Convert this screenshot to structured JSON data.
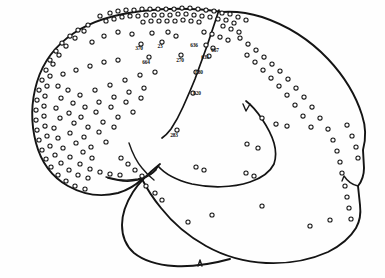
{
  "figure": {
    "background_color": "#fefefe",
    "ink_color": "#141414",
    "dot_fill_color": "#ffffff",
    "view": "lateral",
    "orientation": "frontal pole at left, occipital pole at right"
  },
  "anatomy": {
    "structures": [
      {
        "name": "cerebral-hemisphere-outline",
        "label": "Cerebral hemisphere outline"
      },
      {
        "name": "central-sulcus",
        "label": "Central sulcus"
      },
      {
        "name": "lateral-sulcus",
        "label": "Lateral (Sylvian) fissure"
      },
      {
        "name": "temporal-lobe",
        "label": "Temporal lobe"
      },
      {
        "name": "precentral-sulcus-branch",
        "label": "Precentral sulcus branch"
      },
      {
        "name": "superior-temporal-sulcus",
        "label": "Superior temporal sulcus"
      },
      {
        "name": "occipital-notch",
        "label": "Occipital notch"
      },
      {
        "name": "preoccipital-incisure",
        "label": "Preoccipital incisure"
      }
    ]
  },
  "labels": [
    {
      "id": "label-370",
      "text": "370",
      "x": 139,
      "y": 50,
      "marker_x": 141,
      "marker_y": 44
    },
    {
      "id": "label-23",
      "text": "23",
      "x": 160,
      "y": 48,
      "marker_x": 162,
      "marker_y": 42
    },
    {
      "id": "label-664",
      "text": "664",
      "x": 146,
      "y": 64,
      "marker_x": 149,
      "marker_y": 57
    },
    {
      "id": "label-270",
      "text": "270",
      "x": 180,
      "y": 62,
      "marker_x": 181,
      "marker_y": 55
    },
    {
      "id": "label-636",
      "text": "636",
      "x": 194,
      "y": 47,
      "marker_x": 206,
      "marker_y": 45
    },
    {
      "id": "label-667",
      "text": "667",
      "x": 215,
      "y": 52,
      "marker_x": 213,
      "marker_y": 48
    },
    {
      "id": "label-633",
      "text": "633",
      "x": 205,
      "y": 59,
      "marker_x": 209,
      "marker_y": 56
    },
    {
      "id": "label-680",
      "text": "680",
      "x": 199,
      "y": 74,
      "marker_x": 196,
      "marker_y": 72
    },
    {
      "id": "label-620",
      "text": "620",
      "x": 197,
      "y": 95,
      "marker_x": 193,
      "marker_y": 93
    },
    {
      "id": "label-283",
      "text": "283",
      "x": 174,
      "y": 137,
      "marker_x": 177,
      "marker_y": 130
    }
  ],
  "stimulation_points": {
    "count_visible": 152,
    "marker_shape": "open-circle",
    "marker_radius_px": 2.1,
    "coordinates": [
      [
        100,
        16
      ],
      [
        110,
        13
      ],
      [
        118,
        11
      ],
      [
        126,
        10
      ],
      [
        134,
        10
      ],
      [
        142,
        9
      ],
      [
        150,
        9
      ],
      [
        158,
        9
      ],
      [
        166,
        9
      ],
      [
        174,
        9
      ],
      [
        182,
        8
      ],
      [
        190,
        8
      ],
      [
        198,
        9
      ],
      [
        206,
        10
      ],
      [
        214,
        11
      ],
      [
        222,
        13
      ],
      [
        106,
        21
      ],
      [
        114,
        19
      ],
      [
        122,
        17
      ],
      [
        130,
        16
      ],
      [
        138,
        16
      ],
      [
        146,
        15
      ],
      [
        154,
        15
      ],
      [
        162,
        15
      ],
      [
        170,
        15
      ],
      [
        178,
        14
      ],
      [
        186,
        14
      ],
      [
        194,
        15
      ],
      [
        202,
        16
      ],
      [
        210,
        17
      ],
      [
        218,
        19
      ],
      [
        143,
        22
      ],
      [
        151,
        21
      ],
      [
        159,
        21
      ],
      [
        167,
        21
      ],
      [
        175,
        21
      ],
      [
        183,
        20
      ],
      [
        191,
        21
      ],
      [
        199,
        22
      ],
      [
        230,
        14
      ],
      [
        238,
        17
      ],
      [
        246,
        20
      ],
      [
        226,
        20
      ],
      [
        234,
        23
      ],
      [
        223,
        26
      ],
      [
        231,
        29
      ],
      [
        239,
        32
      ],
      [
        88,
        25
      ],
      [
        78,
        30
      ],
      [
        70,
        36
      ],
      [
        62,
        43
      ],
      [
        56,
        51
      ],
      [
        50,
        60
      ],
      [
        84,
        31
      ],
      [
        75,
        38
      ],
      [
        66,
        46
      ],
      [
        59,
        55
      ],
      [
        53,
        64
      ],
      [
        46,
        70
      ],
      [
        42,
        80
      ],
      [
        39,
        90
      ],
      [
        37,
        100
      ],
      [
        36,
        110
      ],
      [
        36,
        120
      ],
      [
        37,
        130
      ],
      [
        39,
        140
      ],
      [
        42,
        150
      ],
      [
        46,
        159
      ],
      [
        51,
        167
      ],
      [
        58,
        175
      ],
      [
        66,
        181
      ],
      [
        75,
        186
      ],
      [
        85,
        189
      ],
      [
        50,
        76
      ],
      [
        47,
        86
      ],
      [
        45,
        96
      ],
      [
        44,
        106
      ],
      [
        44,
        116
      ],
      [
        45,
        126
      ],
      [
        47,
        136
      ],
      [
        50,
        146
      ],
      [
        55,
        155
      ],
      [
        61,
        163
      ],
      [
        69,
        170
      ],
      [
        78,
        175
      ],
      [
        88,
        178
      ],
      [
        58,
        86
      ],
      [
        61,
        98
      ],
      [
        56,
        108
      ],
      [
        60,
        118
      ],
      [
        54,
        128
      ],
      [
        58,
        138
      ],
      [
        63,
        148
      ],
      [
        70,
        157
      ],
      [
        80,
        164
      ],
      [
        90,
        169
      ],
      [
        100,
        172
      ],
      [
        110,
        174
      ],
      [
        120,
        175
      ],
      [
        68,
        90
      ],
      [
        73,
        103
      ],
      [
        69,
        113
      ],
      [
        74,
        123
      ],
      [
        70,
        133
      ],
      [
        76,
        143
      ],
      [
        83,
        152
      ],
      [
        92,
        158
      ],
      [
        80,
        95
      ],
      [
        85,
        107
      ],
      [
        81,
        117
      ],
      [
        88,
        127
      ],
      [
        84,
        137
      ],
      [
        91,
        147
      ],
      [
        95,
        90
      ],
      [
        99,
        102
      ],
      [
        96,
        112
      ],
      [
        103,
        122
      ],
      [
        99,
        132
      ],
      [
        106,
        142
      ],
      [
        110,
        85
      ],
      [
        114,
        97
      ],
      [
        111,
        107
      ],
      [
        118,
        117
      ],
      [
        114,
        127
      ],
      [
        125,
        80
      ],
      [
        129,
        92
      ],
      [
        126,
        102
      ],
      [
        133,
        112
      ],
      [
        140,
        75
      ],
      [
        144,
        88
      ],
      [
        141,
        98
      ],
      [
        155,
        72
      ],
      [
        118,
        60
      ],
      [
        104,
        62
      ],
      [
        90,
        66
      ],
      [
        76,
        70
      ],
      [
        63,
        74
      ],
      [
        132,
        34
      ],
      [
        118,
        32
      ],
      [
        104,
        36
      ],
      [
        92,
        42
      ],
      [
        152,
        33
      ],
      [
        168,
        32
      ],
      [
        176,
        36
      ],
      [
        204,
        32
      ],
      [
        212,
        34
      ],
      [
        220,
        37
      ],
      [
        228,
        40
      ],
      [
        240,
        38
      ],
      [
        248,
        44
      ],
      [
        256,
        50
      ],
      [
        264,
        57
      ],
      [
        272,
        64
      ],
      [
        280,
        71
      ],
      [
        247,
        55
      ],
      [
        255,
        62
      ],
      [
        263,
        70
      ],
      [
        271,
        78
      ],
      [
        279,
        86
      ],
      [
        288,
        79
      ],
      [
        296,
        88
      ],
      [
        304,
        97
      ],
      [
        312,
        107
      ],
      [
        320,
        118
      ],
      [
        287,
        95
      ],
      [
        295,
        105
      ],
      [
        303,
        116
      ],
      [
        311,
        127
      ],
      [
        328,
        129
      ],
      [
        333,
        140
      ],
      [
        337,
        151
      ],
      [
        340,
        162
      ],
      [
        342,
        173
      ],
      [
        347,
        125
      ],
      [
        352,
        136
      ],
      [
        356,
        147
      ],
      [
        358,
        158
      ],
      [
        345,
        186
      ],
      [
        347,
        197
      ],
      [
        349,
        208
      ],
      [
        351,
        219
      ],
      [
        262,
        118
      ],
      [
        276,
        124
      ],
      [
        287,
        126
      ],
      [
        247,
        144
      ],
      [
        258,
        148
      ],
      [
        246,
        173
      ],
      [
        254,
        176
      ],
      [
        262,
        206
      ],
      [
        121,
        158
      ],
      [
        128,
        164
      ],
      [
        135,
        170
      ],
      [
        142,
        176
      ],
      [
        146,
        186
      ],
      [
        155,
        193
      ],
      [
        162,
        200
      ],
      [
        196,
        167
      ],
      [
        204,
        170
      ],
      [
        212,
        215
      ],
      [
        188,
        222
      ],
      [
        310,
        226
      ],
      [
        330,
        220
      ]
    ]
  }
}
